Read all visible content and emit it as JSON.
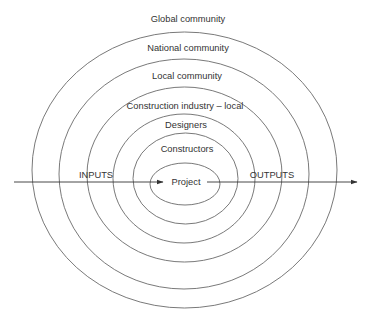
{
  "diagram": {
    "type": "concentric-ellipses",
    "colors": {
      "line": "#6a6a6a",
      "text": "#333333",
      "background": "#ffffff"
    },
    "outer_label": {
      "text": "Global community",
      "x": 188,
      "y": 22
    },
    "rings": [
      {
        "label": "National community",
        "cx": 184.5,
        "cy": 170,
        "rx": 152.5,
        "ry": 138,
        "label_x": 188,
        "label_y": 51
      },
      {
        "label": "Local community",
        "cx": 184,
        "cy": 174,
        "rx": 125,
        "ry": 115,
        "label_x": 187,
        "label_y": 79
      },
      {
        "label": "Construction industry – local",
        "cx": 184.5,
        "cy": 174.5,
        "rx": 97.5,
        "ry": 87.5,
        "label_x": 185,
        "label_y": 109
      },
      {
        "label": "Designers",
        "cx": 184,
        "cy": 178.5,
        "rx": 71,
        "ry": 64.5,
        "label_x": 186,
        "label_y": 128
      },
      {
        "label": "Constructors",
        "cx": 185.5,
        "cy": 178.5,
        "rx": 52.5,
        "ry": 45.5,
        "label_x": 187,
        "label_y": 152
      },
      {
        "label": "Project",
        "cx": 185,
        "cy": 184,
        "rx": 35,
        "ry": 21,
        "label_x": 186,
        "label_y": 185
      }
    ],
    "flow": {
      "inputs_label": "INPUTS",
      "outputs_label": "OUTPUTS",
      "y": 182,
      "in_start_x": 14,
      "in_end_x": 163,
      "out_start_x": 207,
      "out_end_x": 357,
      "inputs_label_x": 96,
      "outputs_label_x": 272,
      "labels_y": 178
    }
  }
}
